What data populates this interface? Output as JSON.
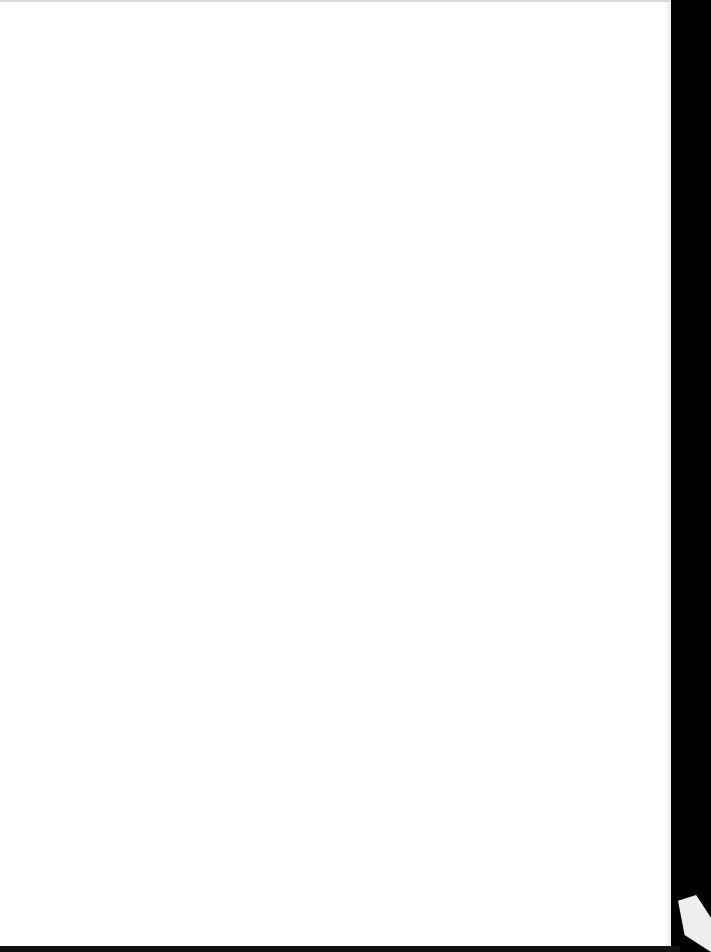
{
  "document": {
    "type": "scanned-page",
    "content": "",
    "colors": {
      "paper": "#ffffff",
      "background": "#000000",
      "corner": "#eeeeee"
    }
  }
}
